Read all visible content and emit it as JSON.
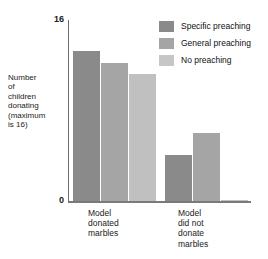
{
  "chart_data": {
    "type": "bar",
    "title": "",
    "xlabel": "",
    "ylabel": "Number\nof\nchildren\ndonating\n(maximum\nis 16)",
    "ylim": [
      0,
      16
    ],
    "ytick_labels": [
      "0",
      "16"
    ],
    "grid": false,
    "legend_position": "top-right",
    "categories": [
      "Model\ndonated\nmarbles",
      "Model\ndid not\ndonate\nmarbles"
    ],
    "series": [
      {
        "name": "Specific preaching",
        "color": "#8a8a8a",
        "values": [
          13.3,
          4.1
        ]
      },
      {
        "name": "General preaching",
        "color": "#a5a5a5",
        "values": [
          12.2,
          6.0
        ]
      },
      {
        "name": "No preaching",
        "color": "#c0c0c0",
        "values": [
          11.2,
          0.1
        ]
      }
    ]
  },
  "axes": {
    "y_top_tick": "16",
    "y_zero_tick": "0",
    "y_caption": "Number\nof\nchildren\ndonating\n(maximum\nis 16)"
  },
  "legend": {
    "items": [
      {
        "label": "Specific preaching",
        "swatch": "#8a8a8a"
      },
      {
        "label": "General preaching",
        "swatch": "#a5a5a5"
      },
      {
        "label": "No preaching",
        "swatch": "#c6c6c6"
      }
    ]
  },
  "x_groups": [
    {
      "label": "Model\ndonated\nmarbles"
    },
    {
      "label": "Model\ndid not\ndonate\nmarbles"
    }
  ]
}
